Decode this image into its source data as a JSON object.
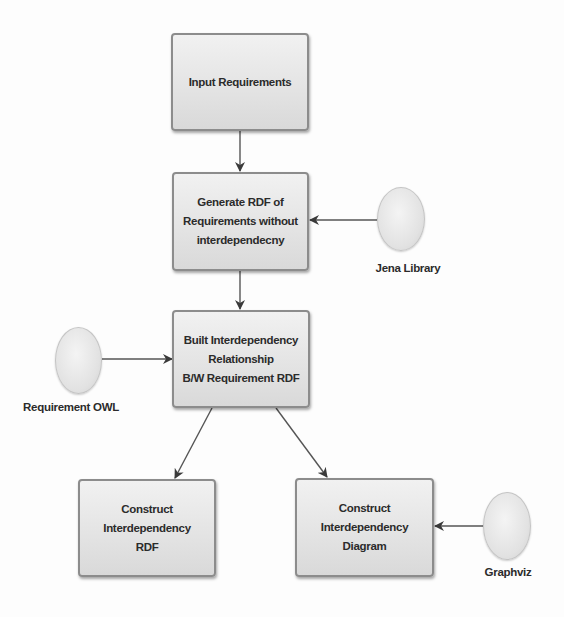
{
  "diagram": {
    "type": "flowchart",
    "nodes": [
      {
        "id": "input_requirements",
        "shape": "rectangle",
        "lines": [
          "Input Requirements"
        ]
      },
      {
        "id": "generate_rdf",
        "shape": "rectangle",
        "lines": [
          "Generate RDF of",
          "Requirements without",
          "interdependecny"
        ]
      },
      {
        "id": "built_interdependency",
        "shape": "rectangle",
        "lines": [
          "Built Interdependency",
          "Relationship",
          "B/W Requirement RDF"
        ]
      },
      {
        "id": "construct_rdf",
        "shape": "rectangle",
        "lines": [
          "Construct",
          "Interdependency",
          "RDF"
        ]
      },
      {
        "id": "construct_diagram",
        "shape": "rectangle",
        "lines": [
          "Construct",
          "Interdependency",
          "Diagram"
        ]
      },
      {
        "id": "jena_library",
        "shape": "ellipse",
        "label": "Jena Library"
      },
      {
        "id": "requirement_owl",
        "shape": "ellipse",
        "label": "Requirement OWL"
      },
      {
        "id": "graphviz",
        "shape": "ellipse",
        "label": "Graphviz"
      }
    ],
    "edges": [
      {
        "from": "input_requirements",
        "to": "generate_rdf"
      },
      {
        "from": "jena_library",
        "to": "generate_rdf"
      },
      {
        "from": "generate_rdf",
        "to": "built_interdependency"
      },
      {
        "from": "requirement_owl",
        "to": "built_interdependency"
      },
      {
        "from": "built_interdependency",
        "to": "construct_rdf"
      },
      {
        "from": "built_interdependency",
        "to": "construct_diagram"
      },
      {
        "from": "graphviz",
        "to": "construct_diagram"
      }
    ]
  },
  "colors": {
    "box_fill": "#e4e4e4",
    "box_border": "#8c8c8c",
    "ellipse_fill": "#e2e2e2",
    "edge": "#555555",
    "text": "#2b2b2b"
  }
}
